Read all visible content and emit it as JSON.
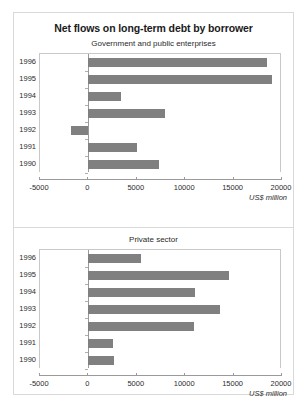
{
  "figure": {
    "title": "Net flows on long-term debt by borrower",
    "units_label": "US$ million"
  },
  "chart_data": [
    {
      "type": "bar",
      "orientation": "horizontal",
      "title": "Government and public enterprises",
      "xlabel": "US$ million",
      "ylabel": "",
      "categories": [
        "1996",
        "1995",
        "1994",
        "1993",
        "1992",
        "1991",
        "1990"
      ],
      "values": [
        18400,
        19000,
        3400,
        7900,
        -1800,
        5000,
        7300
      ],
      "xlim": [
        -5000,
        20000
      ],
      "xticks": [
        -5000,
        0,
        5000,
        10000,
        15000,
        20000
      ],
      "xtick_labels": [
        "-5000",
        "0",
        "5000",
        "10000",
        "15000",
        "20000"
      ],
      "grid": false,
      "legend": "none",
      "bar_color": "#808080"
    },
    {
      "type": "bar",
      "orientation": "horizontal",
      "title": "Private sector",
      "xlabel": "US$ million",
      "ylabel": "",
      "categories": [
        "1996",
        "1995",
        "1994",
        "1993",
        "1992",
        "1991",
        "1990"
      ],
      "values": [
        5400,
        14500,
        11000,
        13600,
        10900,
        2500,
        2600
      ],
      "xlim": [
        -5000,
        20000
      ],
      "xticks": [
        -5000,
        0,
        5000,
        10000,
        15000,
        20000
      ],
      "xtick_labels": [
        "-5000",
        "0",
        "5000",
        "10000",
        "15000",
        "20000"
      ],
      "grid": false,
      "legend": "none",
      "bar_color": "#808080"
    }
  ]
}
